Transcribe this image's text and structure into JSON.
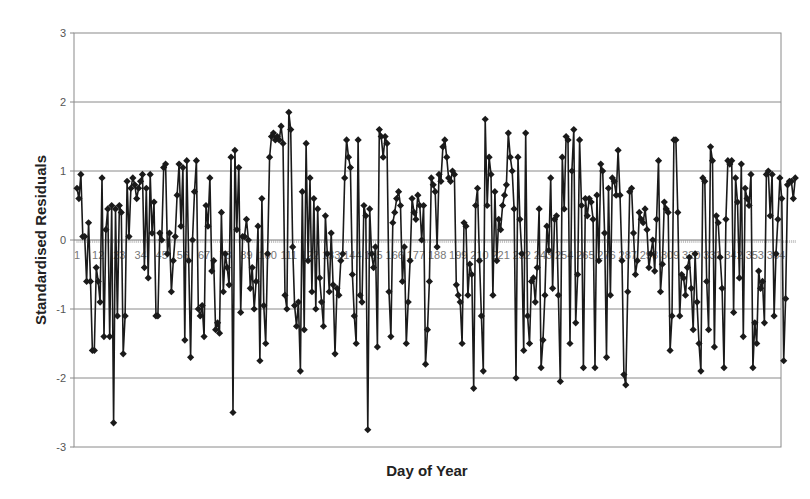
{
  "chart_data": {
    "type": "line",
    "title": "",
    "xlabel": "Day of Year",
    "ylabel": "Standardised Residuals",
    "ylim": [
      -3,
      3
    ],
    "yticks": [
      "3",
      "2",
      "1",
      "0",
      "-1",
      "-2",
      "-3"
    ],
    "xlim": [
      1,
      364
    ],
    "xticks": [
      "1",
      "12",
      "23",
      "34",
      "45",
      "56",
      "67",
      "78",
      "89",
      "100",
      "111",
      "122",
      "133",
      "144",
      "155",
      "166",
      "177",
      "188",
      "199",
      "210",
      "221",
      "232",
      "243",
      "254",
      "265",
      "276",
      "287",
      "298",
      "309",
      "320",
      "331",
      "342",
      "353",
      "364"
    ],
    "grid": "horizontal",
    "legend": "none",
    "marker": "diamond",
    "series": [
      {
        "name": "Standardised Residuals",
        "color": "#1a1a1a",
        "x_start": 1,
        "values": [
          0.75,
          0.6,
          0.95,
          0.05,
          0.05,
          -0.6,
          0.25,
          -0.6,
          -1.6,
          -1.6,
          -0.4,
          -0.6,
          -0.9,
          0.9,
          -1.4,
          0.15,
          0.45,
          -1.4,
          0.5,
          -2.65,
          0.45,
          -1.1,
          0.5,
          0.4,
          -1.65,
          -1.1,
          0.85,
          0.05,
          0.75,
          0.9,
          0.8,
          0.6,
          0.75,
          0.85,
          0.95,
          -0.4,
          0.75,
          -0.55,
          0.95,
          0.1,
          0.55,
          -1.1,
          -1.1,
          0.1,
          0.0,
          1.05,
          1.1,
          -0.2,
          0.1,
          -0.75,
          -0.3,
          0.05,
          0.65,
          1.1,
          0.2,
          1.05,
          -1.45,
          1.15,
          -0.3,
          -1.7,
          0.0,
          0.7,
          1.15,
          -1.0,
          -1.1,
          -0.95,
          -1.4,
          0.5,
          0.2,
          0.9,
          -0.45,
          -0.3,
          -1.3,
          -1.2,
          -1.35,
          0.4,
          -0.75,
          -0.2,
          -0.4,
          -0.65,
          1.2,
          -2.5,
          1.3,
          0.15,
          1.05,
          -1.05,
          0.05,
          0.05,
          0.3,
          0.0,
          -0.7,
          -0.4,
          -1.0,
          -0.6,
          0.2,
          -1.75,
          0.6,
          -0.95,
          -1.5,
          -0.2,
          1.2,
          1.5,
          1.55,
          1.45,
          1.5,
          1.45,
          1.65,
          1.4,
          -0.8,
          -1.0,
          1.85,
          1.6,
          -0.1,
          -0.95,
          -1.25,
          -0.9,
          -1.9,
          0.7,
          -1.3,
          1.4,
          -0.3,
          0.9,
          -0.75,
          0.6,
          -1.0,
          0.45,
          -0.55,
          -0.9,
          -1.25,
          0.35,
          -0.2,
          -0.75,
          0.1,
          -0.65,
          -1.65,
          -0.7,
          -0.8,
          -0.3,
          -0.2,
          0.9,
          1.45,
          1.2,
          1.05,
          -0.5,
          -1.1,
          -1.5,
          1.45,
          -0.8,
          -0.9,
          0.5,
          0.35,
          -2.75,
          0.45,
          -0.2,
          -0.4,
          -0.1,
          -1.55,
          1.6,
          1.5,
          1.2,
          1.5,
          1.4,
          -0.75,
          -1.4,
          0.25,
          0.4,
          0.6,
          0.7,
          0.5,
          -0.6,
          -0.1,
          -1.5,
          -0.9,
          -0.3,
          0.6,
          0.4,
          0.3,
          0.65,
          0.5,
          0.0,
          0.5,
          -1.8,
          -1.3,
          -0.6,
          0.9,
          0.8,
          0.7,
          -0.1,
          0.95,
          0.85,
          1.35,
          1.45,
          1.2,
          0.9,
          0.85,
          1.0,
          0.95,
          -0.65,
          -0.8,
          -0.9,
          -1.5,
          0.25,
          0.2,
          -0.8,
          -0.35,
          -0.5,
          -2.15,
          0.5,
          0.75,
          -0.3,
          -1.1,
          -1.9,
          1.75,
          0.5,
          1.2,
          0.95,
          -0.8,
          0.7,
          -0.3,
          0.3,
          0.15,
          0.5,
          0.65,
          0.8,
          1.55,
          1.2,
          1.0,
          0.45,
          -2.0,
          1.2,
          0.3,
          -0.2,
          -1.6,
          1.55,
          -1.1,
          -1.5,
          -0.6,
          -0.55,
          -0.9,
          -0.4,
          0.45,
          -1.85,
          -1.45,
          -0.8,
          0.2,
          -0.15,
          0.9,
          -0.7,
          0.3,
          0.35,
          -0.8,
          -2.05,
          1.2,
          0.45,
          1.5,
          1.45,
          -1.5,
          1.0,
          1.6,
          -1.2,
          -0.5,
          1.45,
          0.5,
          -1.85,
          0.6,
          0.35,
          0.6,
          0.55,
          0.3,
          -1.85,
          0.65,
          -0.3,
          1.1,
          1.0,
          0.1,
          -1.7,
          0.75,
          -0.8,
          0.9,
          0.85,
          0.65,
          1.3,
          0.65,
          -0.3,
          -1.95,
          -2.1,
          -0.75,
          0.7,
          0.75,
          0.1,
          -0.5,
          -0.3,
          0.4,
          0.3,
          0.25,
          0.45,
          0.15,
          -0.4,
          -0.2,
          0.0,
          -0.45,
          0.3,
          1.15,
          -0.75,
          -0.35,
          0.55,
          0.45,
          0.4,
          -1.6,
          -1.1,
          1.45,
          1.45,
          0.4,
          -1.1,
          -0.5,
          -0.55,
          -0.8,
          -0.4,
          -0.25,
          -0.7,
          -1.3,
          -0.2,
          -0.9,
          -1.5,
          -1.9,
          0.9,
          0.85,
          -0.6,
          -1.3,
          1.35,
          1.15,
          -1.55,
          0.35,
          0.25,
          -0.25,
          -0.7,
          -1.85,
          0.3,
          1.15,
          1.1,
          1.15,
          -1.05,
          0.9,
          0.55,
          -0.55,
          1.1,
          -1.4,
          0.75,
          0.6,
          0.5,
          0.95,
          -1.85,
          -1.2,
          -1.5,
          -0.45,
          -0.7,
          -0.6,
          -1.2,
          0.95,
          1.0,
          0.35,
          0.95,
          -1.1,
          -0.2,
          0.3,
          0.9,
          0.6,
          -1.75,
          -0.85,
          0.8,
          0.85,
          0.85,
          0.6,
          0.9
        ]
      }
    ]
  }
}
